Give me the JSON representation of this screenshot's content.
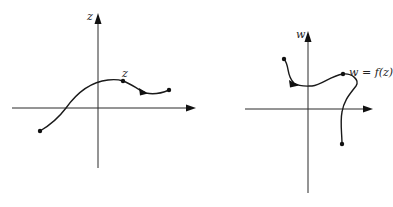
{
  "figure": {
    "left_panel": {
      "axis_label": "z",
      "point_label": "z",
      "description": "Path in the z-plane with a marked point z"
    },
    "right_panel": {
      "axis_label": "w",
      "point_label": "w = f(z)",
      "description": "Image path in the w-plane with marked point w = f(z)"
    }
  },
  "colors": {
    "ink": "#1a1a1a",
    "background": "#ffffff"
  }
}
